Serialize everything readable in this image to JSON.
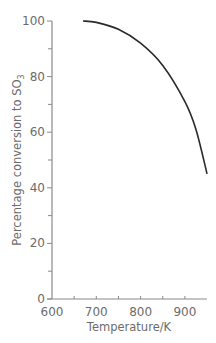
{
  "chart_data": {
    "type": "line",
    "title": "",
    "xlabel": "Temperature/K",
    "ylabel": "Percentage conversion to SO3",
    "ylabel_main": "Percentage conversion to SO",
    "ylabel_sub": "3",
    "xlim": [
      600,
      950
    ],
    "ylim": [
      0,
      100
    ],
    "x_ticks": [
      "600",
      "700",
      "800",
      "900"
    ],
    "y_ticks": [
      "0",
      "20",
      "40",
      "60",
      "80",
      "100"
    ],
    "grid": false,
    "legend": null,
    "series": [
      {
        "name": "Conversion of SO2 to SO3",
        "x": [
          670,
          700,
          750,
          800,
          850,
          900,
          925,
          950
        ],
        "values": [
          100,
          99.5,
          97,
          92,
          84,
          71,
          61,
          45
        ]
      }
    ]
  },
  "colors": {
    "axis": "#8a8a8a",
    "curve": "#2a2a2a",
    "text": "#6b6b6b"
  }
}
